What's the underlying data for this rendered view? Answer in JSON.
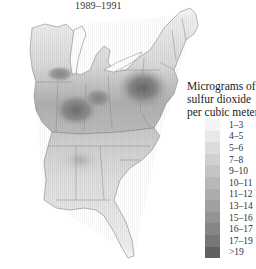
{
  "title": "1989–1991",
  "legend": {
    "title_lines": [
      "Micrograms of",
      "sulfur dioxide",
      "per cubic meter"
    ],
    "items": [
      {
        "label": "1–3",
        "color": "#f4f4f4"
      },
      {
        "label": "4–5",
        "color": "#e8e8e8"
      },
      {
        "label": "5–6",
        "color": "#dcdcdc"
      },
      {
        "label": "7–8",
        "color": "#d0d0d0"
      },
      {
        "label": "9–10",
        "color": "#c4c4c4"
      },
      {
        "label": "10–11",
        "color": "#b8b8b8"
      },
      {
        "label": "11–12",
        "color": "#acacac"
      },
      {
        "label": "13–14",
        "color": "#a0a0a0"
      },
      {
        "label": "15–16",
        "color": "#939393"
      },
      {
        "label": "16–17",
        "color": "#868686"
      },
      {
        "label": "17–19",
        "color": "#777777"
      },
      {
        "label": ">19",
        "color": "#606060"
      }
    ]
  },
  "map": {
    "region": "Eastern United States",
    "measure": "Sulfur dioxide concentration",
    "hotspots": [
      "Ohio River Valley",
      "Western Pennsylvania",
      "Southern Indiana",
      "Northern Illinois"
    ]
  }
}
